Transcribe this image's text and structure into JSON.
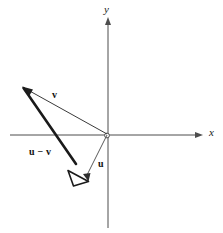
{
  "figure": {
    "width": 223,
    "height": 233,
    "background_color": "#ffffff"
  },
  "axes": {
    "x_label": "x",
    "y_label": "y",
    "origin": {
      "x": 108,
      "y": 135
    },
    "x_axis": {
      "start_x": 10,
      "end_x": 202,
      "y": 135,
      "arrow": "right"
    },
    "y_axis": {
      "x": 108,
      "start_y": 228,
      "end_y": 18,
      "arrow": "up"
    },
    "line_color": "#4d4d4d",
    "line_width": 1
  },
  "vectors": [
    {
      "name": "v",
      "label": "v",
      "label_style": "bold",
      "from": {
        "x": 108,
        "y": 135
      },
      "to": {
        "x": 23,
        "y": 87
      },
      "stroke_width": 1,
      "color": "#2b2b2b",
      "arrowhead": "filled",
      "label_position": {
        "x": 52,
        "y": 90
      }
    },
    {
      "name": "u",
      "label": "u",
      "label_style": "bold",
      "from": {
        "x": 108,
        "y": 135
      },
      "to": {
        "x": 88,
        "y": 180
      },
      "stroke_width": 1,
      "color": "#555555",
      "arrowhead": "filled",
      "label_position": {
        "x": 98,
        "y": 159
      }
    },
    {
      "name": "u-minus-v",
      "label": "u − v",
      "label_style": "bold",
      "from": {
        "x": 23,
        "y": 87
      },
      "to": {
        "x": 88,
        "y": 181
      },
      "stroke_width": 2.6,
      "color": "#1a1a1a",
      "arrowhead": "open",
      "label_position": {
        "x": 29,
        "y": 147
      }
    }
  ],
  "colors": {
    "axis": "#4d4d4d",
    "vector_primary": "#1a1a1a",
    "vector_secondary": "#555555",
    "text": "#111111"
  }
}
